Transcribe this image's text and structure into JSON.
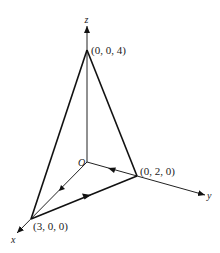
{
  "diagram": {
    "title": "",
    "axes": {
      "x": {
        "label": "x",
        "tip": [
          16,
          233
        ]
      },
      "y": {
        "label": "y",
        "tip": [
          205,
          195
        ]
      },
      "z": {
        "label": "z",
        "tip": [
          87,
          25
        ]
      }
    },
    "origin": {
      "label": "O",
      "pos": [
        87,
        162
      ]
    },
    "vertices": [
      {
        "id": "apex",
        "label": "(0, 0, 4)",
        "pos": [
          87,
          50
        ]
      },
      {
        "id": "ypt",
        "label": "(0, 2, 0)",
        "pos": [
          137,
          176
        ]
      },
      {
        "id": "xpt",
        "label": "(3, 0, 0)",
        "pos": [
          31,
          219
        ]
      }
    ],
    "edges": [
      {
        "from": "apex",
        "to": "xpt",
        "weight": "bold"
      },
      {
        "from": "apex",
        "to": "ypt",
        "weight": "bold"
      },
      {
        "from": "xpt",
        "to": "ypt",
        "weight": "bold",
        "arrow": "toward (0, 2, 0)"
      },
      {
        "from": "ypt",
        "to": "O",
        "weight": "thin",
        "arrow": "toward O"
      },
      {
        "from": "O",
        "to": "xpt",
        "weight": "thin",
        "arrow": "toward (3, 0, 0)"
      }
    ]
  }
}
